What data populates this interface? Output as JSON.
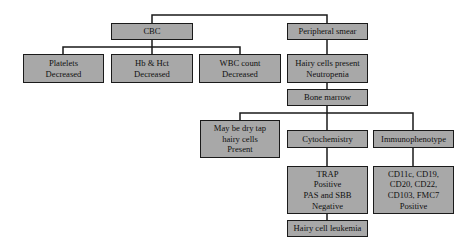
{
  "diagram": {
    "type": "flowchart",
    "colors": {
      "box_fill": "#a8a8a8",
      "box_border": "#1a1a1a",
      "line": "#1a1a1a",
      "background": "#ffffff"
    },
    "nodes": {
      "cbc": {
        "lines": [
          "CBC"
        ]
      },
      "peripheral_smear": {
        "lines": [
          "Peripheral smear"
        ]
      },
      "platelets": {
        "lines": [
          "Platelets",
          "Decreased"
        ]
      },
      "hb_hct": {
        "lines": [
          "Hb & Hct",
          "Decreased"
        ]
      },
      "wbc": {
        "lines": [
          "WBC count",
          "Decreased"
        ]
      },
      "hairy_cells": {
        "lines": [
          "Hairy cells present",
          "Neutropenia"
        ]
      },
      "bone_marrow": {
        "lines": [
          "Bone marrow"
        ]
      },
      "dry_tap": {
        "lines": [
          "May be dry tap",
          "hairy cells",
          "Present"
        ]
      },
      "cytochemistry": {
        "lines": [
          "Cytochemistry"
        ]
      },
      "immunophenotype": {
        "lines": [
          "Immunophenotype"
        ]
      },
      "trap": {
        "lines": [
          "TRAP",
          "Positive",
          "PAS and SBB",
          "Negative"
        ]
      },
      "cd_markers": {
        "lines": [
          "CD11c, CD19,",
          "CD20, CD22,",
          "CD103, FMC7",
          "Positive"
        ]
      },
      "hcl": {
        "lines": [
          "Hairy cell leukemia"
        ]
      }
    },
    "edges": [
      [
        "cbc",
        "peripheral_smear"
      ],
      [
        "cbc",
        "platelets"
      ],
      [
        "cbc",
        "hb_hct"
      ],
      [
        "cbc",
        "wbc"
      ],
      [
        "peripheral_smear",
        "hairy_cells"
      ],
      [
        "hairy_cells",
        "bone_marrow"
      ],
      [
        "bone_marrow",
        "dry_tap"
      ],
      [
        "bone_marrow",
        "cytochemistry"
      ],
      [
        "bone_marrow",
        "immunophenotype"
      ],
      [
        "cytochemistry",
        "trap"
      ],
      [
        "immunophenotype",
        "cd_markers"
      ],
      [
        "trap",
        "hcl"
      ]
    ]
  }
}
